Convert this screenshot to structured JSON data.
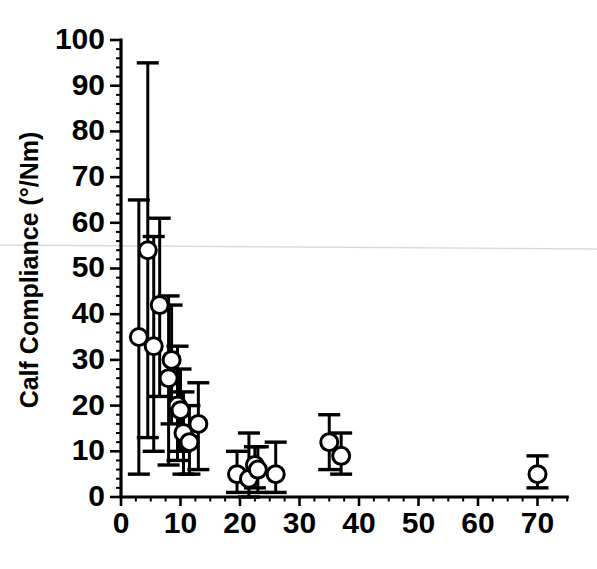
{
  "figure": {
    "background_color": "#ffffff",
    "ink_color": "#000000",
    "marker_fill": "#ffffff",
    "artifact_color": "#d9d9d9"
  },
  "chart_data": {
    "type": "scatter",
    "title": "",
    "subtitle": "",
    "xlabel": "",
    "ylabel": "Calf Compliance (°/Nm)",
    "xlim": [
      0,
      75
    ],
    "ylim": [
      0,
      100
    ],
    "xticks": [
      0,
      10,
      20,
      30,
      40,
      50,
      60,
      70
    ],
    "xtick_labels": [
      "0",
      "10",
      "20",
      "30",
      "40",
      "50",
      "60",
      "70"
    ],
    "yticks": [
      0,
      10,
      20,
      30,
      40,
      50,
      60,
      70,
      80,
      90,
      100
    ],
    "ytick_labels": [
      "0",
      "10",
      "20",
      "30",
      "40",
      "50",
      "60",
      "70",
      "80",
      "90",
      "100"
    ],
    "y_minor_tick_step": 2,
    "x_minor_tick_step": 2.5,
    "grid": false,
    "legend": null,
    "legend_position": "none",
    "marker_style": "open-circle",
    "error_bars": "vertical-with-caps",
    "series": [
      {
        "name": "Calf compliance vs. subject index",
        "marker": "open-circle",
        "points": [
          {
            "x": 3.0,
            "y": 35,
            "yerr_low": 5,
            "yerr_high": 65
          },
          {
            "x": 4.5,
            "y": 54,
            "yerr_low": 13,
            "yerr_high": 95
          },
          {
            "x": 5.5,
            "y": 33,
            "yerr_low": 10,
            "yerr_high": 57
          },
          {
            "x": 6.5,
            "y": 42,
            "yerr_low": 22,
            "yerr_high": 61
          },
          {
            "x": 8.0,
            "y": 26,
            "yerr_low": 7,
            "yerr_high": 44
          },
          {
            "x": 8.5,
            "y": 30,
            "yerr_low": 16,
            "yerr_high": 42
          },
          {
            "x": 9.5,
            "y": 20,
            "yerr_low": 8,
            "yerr_high": 33
          },
          {
            "x": 10.0,
            "y": 19,
            "yerr_low": 10,
            "yerr_high": 28
          },
          {
            "x": 10.5,
            "y": 14,
            "yerr_low": 5,
            "yerr_high": 23
          },
          {
            "x": 11.5,
            "y": 12,
            "yerr_low": 5,
            "yerr_high": 20
          },
          {
            "x": 13.0,
            "y": 16,
            "yerr_low": 6,
            "yerr_high": 25
          },
          {
            "x": 19.5,
            "y": 5,
            "yerr_low": 1,
            "yerr_high": 10
          },
          {
            "x": 21.5,
            "y": 4,
            "yerr_low": 0,
            "yerr_high": 14
          },
          {
            "x": 22.5,
            "y": 7,
            "yerr_low": 2,
            "yerr_high": 11
          },
          {
            "x": 23.0,
            "y": 6,
            "yerr_low": 1,
            "yerr_high": 11
          },
          {
            "x": 26.0,
            "y": 5,
            "yerr_low": 1,
            "yerr_high": 12
          },
          {
            "x": 35.0,
            "y": 12,
            "yerr_low": 6,
            "yerr_high": 18
          },
          {
            "x": 37.0,
            "y": 9,
            "yerr_low": 5,
            "yerr_high": 14
          },
          {
            "x": 70.0,
            "y": 5,
            "yerr_low": 2,
            "yerr_high": 9
          }
        ]
      }
    ]
  }
}
